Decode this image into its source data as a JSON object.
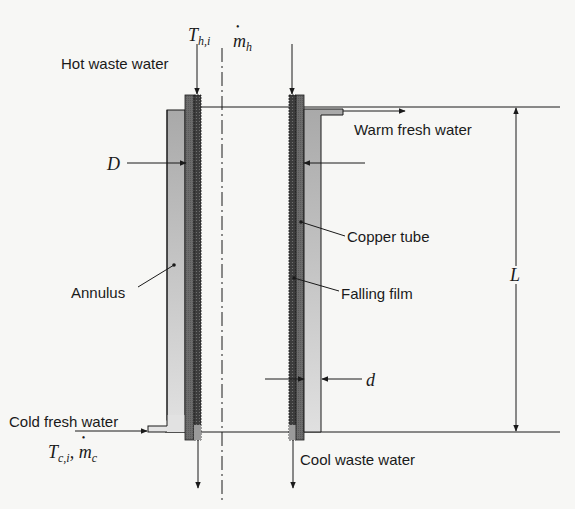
{
  "diagram": {
    "type": "falling-film heat exchanger schematic (vertical cross-section)",
    "colors": {
      "background": "#f7f7f5",
      "line": "#1a1a1a",
      "annulus": "#b4b4b4",
      "copper_tube": "#6a6a6a",
      "falling_film": "#3c3c3c"
    },
    "labels": {
      "hot_inlet": "Hot waste water",
      "warm_outlet": "Warm fresh water",
      "copper_tube": "Copper tube",
      "falling_film": "Falling film",
      "annulus": "Annulus",
      "cold_inlet": "Cold fresh water",
      "cool_outlet": "Cool waste water"
    },
    "symbols": {
      "T_hot_in": {
        "base": "T",
        "sub": "h,i"
      },
      "m_hot": {
        "base": "m",
        "sub": "h"
      },
      "D": "D",
      "d": "d",
      "L": "L",
      "T_cold_in": {
        "base": "T",
        "sub": "c,i"
      },
      "m_cold": {
        "base": "m",
        "sub": "c"
      },
      "separator": ","
    }
  }
}
